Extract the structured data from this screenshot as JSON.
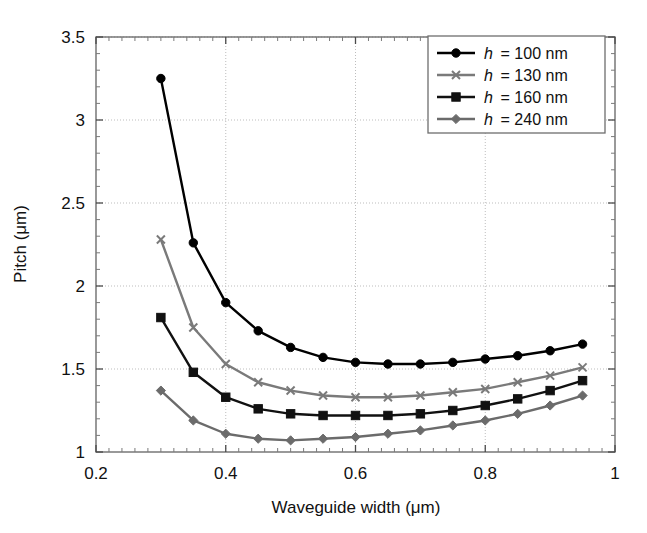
{
  "chart_data": {
    "type": "line",
    "title": "",
    "xlabel": "Waveguide width (μm)",
    "ylabel": "Pitch (μm)",
    "xlim": [
      0.2,
      1.0
    ],
    "ylim": [
      1.0,
      3.5
    ],
    "xticks": [
      0.2,
      0.4,
      0.6,
      0.8,
      1.0
    ],
    "xtick_labels": [
      "0.2",
      "0.4",
      "0.6",
      "0.8",
      "1"
    ],
    "yticks": [
      1.0,
      1.5,
      2.0,
      2.5,
      3.0,
      3.5
    ],
    "ytick_labels": [
      "1",
      "1.5",
      "2",
      "2.5",
      "3",
      "3.5"
    ],
    "grid": true,
    "legend_position": "top-right",
    "x": [
      0.3,
      0.35,
      0.4,
      0.45,
      0.5,
      0.55,
      0.6,
      0.65,
      0.7,
      0.75,
      0.8,
      0.85,
      0.9,
      0.95
    ],
    "series": [
      {
        "name": "h = 100 nm",
        "label_var": "h",
        "label_value": "100 nm",
        "color": "#000000",
        "marker": "circle",
        "values": [
          3.25,
          2.26,
          1.9,
          1.73,
          1.63,
          1.57,
          1.54,
          1.53,
          1.53,
          1.54,
          1.56,
          1.58,
          1.61,
          1.65
        ]
      },
      {
        "name": "h = 130 nm",
        "label_var": "h",
        "label_value": "130 nm",
        "color": "#7a7a7a",
        "marker": "x",
        "values": [
          2.28,
          1.75,
          1.53,
          1.42,
          1.37,
          1.34,
          1.33,
          1.33,
          1.34,
          1.36,
          1.38,
          1.42,
          1.46,
          1.51
        ]
      },
      {
        "name": "h = 160 nm",
        "label_var": "h",
        "label_value": "160 nm",
        "color": "#111111",
        "marker": "square",
        "values": [
          1.81,
          1.48,
          1.33,
          1.26,
          1.23,
          1.22,
          1.22,
          1.22,
          1.23,
          1.25,
          1.28,
          1.32,
          1.37,
          1.43
        ]
      },
      {
        "name": "h = 240 nm",
        "label_var": "h",
        "label_value": "240 nm",
        "color": "#6b6b6b",
        "marker": "diamond",
        "values": [
          1.37,
          1.19,
          1.11,
          1.08,
          1.07,
          1.08,
          1.09,
          1.11,
          1.13,
          1.16,
          1.19,
          1.23,
          1.28,
          1.34
        ]
      }
    ]
  },
  "legend": {
    "entries": [
      {
        "text": "h = 100 nm"
      },
      {
        "text": "h = 130 nm"
      },
      {
        "text": "h = 160 nm"
      },
      {
        "text": "h = 240 nm"
      }
    ]
  }
}
